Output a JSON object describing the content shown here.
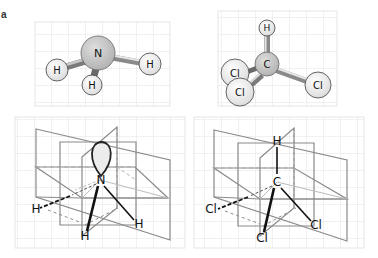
{
  "figure": {
    "panel_label": "a",
    "colors": {
      "grid": "#dcdcdc",
      "panel_border": "#cccccc",
      "plane_line": "#8a8a8a",
      "dashed_line": "#9a9a9a",
      "bond_dark": "#111111",
      "central_atom_fill": "#c4c4c4",
      "peripheral_atom_fill": "#f2f2f2",
      "lone_pair_fill": "#ececec"
    },
    "panels": [
      {
        "id": "ammonia-ball-stick",
        "molecule": "NH3",
        "central_atom": "N",
        "atoms": [
          "N",
          "H",
          "H",
          "H"
        ]
      },
      {
        "id": "chloroform-ball-stick",
        "molecule": "CHCl3",
        "central_atom": "C",
        "atoms": [
          "C",
          "H",
          "Cl",
          "Cl",
          "Cl"
        ]
      },
      {
        "id": "ammonia-planes",
        "molecule": "NH3",
        "central_atom": "N",
        "atoms": [
          "N",
          "H",
          "H",
          "H"
        ],
        "has_lone_pair": true
      },
      {
        "id": "chloroform-planes",
        "molecule": "CHCl3",
        "central_atom": "C",
        "atoms": [
          "C",
          "H",
          "Cl",
          "Cl",
          "Cl"
        ]
      }
    ]
  }
}
